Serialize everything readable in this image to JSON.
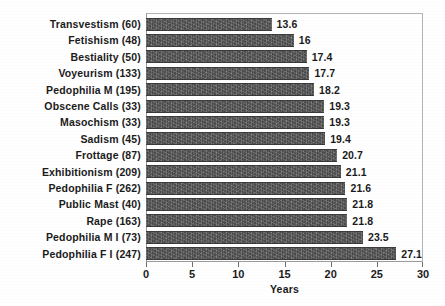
{
  "chart_data": {
    "type": "bar",
    "orientation": "horizontal",
    "title": "",
    "xlabel": "Years",
    "ylabel": "",
    "xlim": [
      0,
      30
    ],
    "xticks": [
      0,
      5,
      10,
      15,
      20,
      25,
      30
    ],
    "grid": false,
    "legend": null,
    "categories": [
      "Transvestism (60)",
      "Fetishism (48)",
      "Bestiality (50)",
      "Voyeurism (133)",
      "Pedophilia M (195)",
      "Obscene Calls (33)",
      "Masochism (33)",
      "Sadism (45)",
      "Frottage (87)",
      "Exhibitionism (209)",
      "Pedophilia F (262)",
      "Public Mast (40)",
      "Rape (163)",
      "Pedophilia M I (73)",
      "Pedophilia F I (247)"
    ],
    "values": [
      13.6,
      16,
      17.4,
      17.7,
      18.2,
      19.3,
      19.3,
      19.4,
      20.7,
      21.1,
      21.6,
      21.8,
      21.8,
      23.5,
      27.1
    ],
    "value_labels": [
      "13.6",
      "16",
      "17.4",
      "17.7",
      "18.2",
      "19.3",
      "19.3",
      "19.4",
      "20.7",
      "21.1",
      "21.6",
      "21.8",
      "21.8",
      "23.5",
      "27.1"
    ],
    "bar_color": "#595959",
    "axis_color": "#9a9a9a",
    "text_color": "#1b1b1b",
    "background_color": "#ffffff"
  }
}
